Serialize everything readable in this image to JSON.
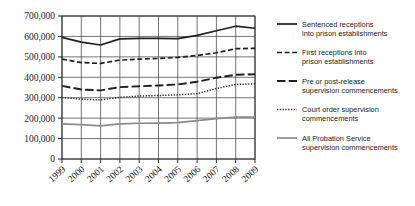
{
  "chart_data": {
    "type": "line",
    "title": "",
    "xlabel": "",
    "ylabel": "",
    "grid": true,
    "legend_position": "right",
    "ylim": [
      0,
      700000
    ],
    "ytick_labels": [
      "700,000",
      "600,000",
      "500,000",
      "400,000",
      "300,000",
      "200,000",
      "100,000",
      "0"
    ],
    "ytick_values": [
      700000,
      600000,
      500000,
      400000,
      300000,
      200000,
      100000,
      0
    ],
    "categories": [
      "1999",
      "2000",
      "2001",
      "2002",
      "2003",
      "2004",
      "2005",
      "2006",
      "2007",
      "2008",
      "2009"
    ],
    "x": [
      1999,
      2000,
      2001,
      2002,
      2003,
      2004,
      2005,
      2006,
      2007,
      2008,
      2009
    ],
    "series": [
      {
        "name": "Sentenced receptions into prison establishments",
        "style": "solid",
        "color": "#1f1f1f",
        "width": 1.7,
        "values": [
          595000,
          572000,
          558000,
          588000,
          590000,
          590000,
          589000,
          605000,
          628000,
          650000,
          640000
        ]
      },
      {
        "name": "First receptions into prison establishments",
        "style": "short-dash",
        "color": "#1f1f1f",
        "width": 1.7,
        "values": [
          489000,
          472000,
          468000,
          484000,
          489000,
          492000,
          497000,
          507000,
          520000,
          540000,
          542000
        ]
      },
      {
        "name": "Pre or post-release supervision commencements",
        "style": "long-dash",
        "color": "#1f1f1f",
        "width": 1.9,
        "values": [
          358000,
          340000,
          336000,
          352000,
          356000,
          360000,
          365000,
          378000,
          398000,
          412000,
          415000
        ]
      },
      {
        "name": "Court order supervision commencements",
        "style": "dotted",
        "color": "#2b2b2b",
        "width": 1.5,
        "values": [
          301000,
          293000,
          289000,
          302000,
          308000,
          311000,
          314000,
          320000,
          345000,
          365000,
          368000
        ]
      },
      {
        "name": "All Probation Service supervision commencements",
        "style": "solid",
        "color": "#8a8a8a",
        "width": 1.7,
        "values": [
          172000,
          168000,
          162000,
          172000,
          175000,
          176000,
          178000,
          188000,
          198000,
          205000,
          205000
        ]
      }
    ]
  },
  "legend": {
    "entries": [
      {
        "label_line1": "Sentenced receptions",
        "label_line2": "into prison establishments"
      },
      {
        "label_line1": "First receptions into",
        "label_line2": "prison establishments"
      },
      {
        "label_line1": "Pre or post-release",
        "label_line2": "supervision commencements"
      },
      {
        "label_line1": "Court order supervision",
        "label_line2": "commencements"
      },
      {
        "label_line1": "All Probation Service",
        "label_line2": "supervision commencements"
      }
    ]
  },
  "colors": {
    "background": "#ffffff",
    "grid": "#3a3a3a",
    "axis": "#2b2b2b",
    "text": "#1a1a1a",
    "gray_series": "#8a8a8a"
  }
}
